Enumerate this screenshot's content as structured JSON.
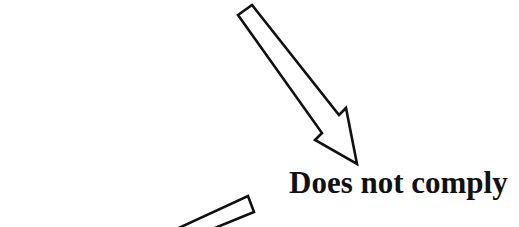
{
  "diagram": {
    "label": "Does not comply",
    "elements": [
      {
        "type": "arrow",
        "name": "upper-arrow",
        "direction": "down-right",
        "style": "outline"
      },
      {
        "type": "arrow",
        "name": "lower-arrow",
        "direction": "down-left",
        "style": "outline",
        "partially_visible": true
      },
      {
        "type": "text",
        "value": "Does not comply"
      }
    ],
    "colors": {
      "stroke": "#111111",
      "fill": "#ffffff",
      "background": "#ffffff"
    }
  }
}
